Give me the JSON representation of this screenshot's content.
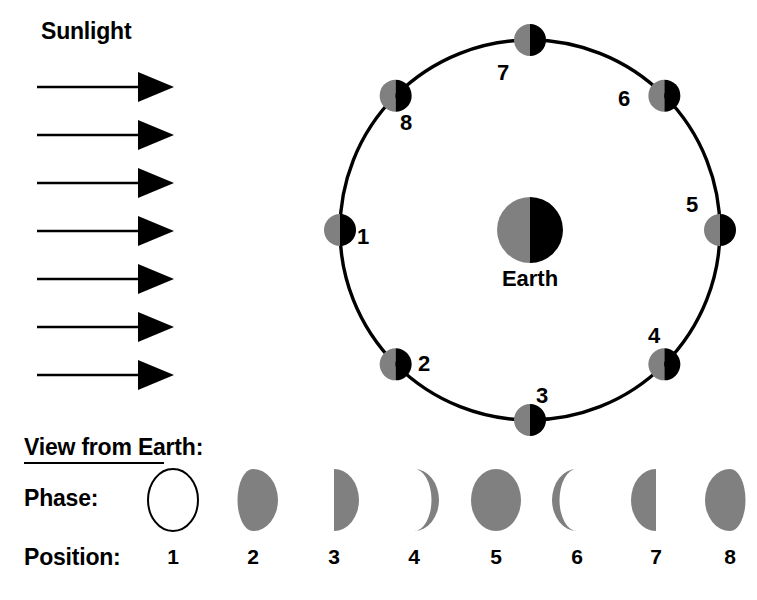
{
  "figure": {
    "title_sunlight": "Sunlight",
    "earth_label": "Earth",
    "view_label": "View from Earth:",
    "phase_label": "Phase:",
    "position_label": "Position:"
  },
  "colors": {
    "lit": "#808080",
    "dark": "#000000",
    "outline": "#000000",
    "background": "#ffffff"
  },
  "chart_data": {
    "type": "diagram",
    "sunlight": {
      "label": "Sunlight",
      "direction": "left-to-right",
      "arrow_count": 7
    },
    "earth": {
      "label": "Earth",
      "lit_side": "left",
      "dark_side": "right"
    },
    "orbit": {
      "center_x": 530,
      "center_y": 230,
      "radius": 190,
      "moon_lit_side": "left",
      "moon_dark_side": "right",
      "order": "counterclockwise from left"
    },
    "positions": [
      {
        "number": "1",
        "angle_deg": 180,
        "label_side": "right",
        "phase_name": "New Moon",
        "illumination": 0.0,
        "lit_limb": "none"
      },
      {
        "number": "2",
        "angle_deg": 225,
        "label_side": "upper-right",
        "phase_name": "Waxing Crescent",
        "illumination": 0.15,
        "lit_limb": "right"
      },
      {
        "number": "3",
        "angle_deg": 270,
        "label_side": "above",
        "phase_name": "First Quarter",
        "illumination": 0.5,
        "lit_limb": "right"
      },
      {
        "number": "4",
        "angle_deg": 315,
        "label_side": "upper-left",
        "phase_name": "Waxing Gibbous",
        "illumination": 0.8,
        "lit_limb": "right"
      },
      {
        "number": "5",
        "angle_deg": 0,
        "label_side": "upper-left",
        "phase_name": "Full Moon",
        "illumination": 1.0,
        "lit_limb": "full"
      },
      {
        "number": "6",
        "angle_deg": 45,
        "label_side": "left",
        "phase_name": "Waning Gibbous",
        "illumination": 0.8,
        "lit_limb": "left"
      },
      {
        "number": "7",
        "angle_deg": 90,
        "label_side": "below-left",
        "phase_name": "Last Quarter",
        "illumination": 0.5,
        "lit_limb": "left"
      },
      {
        "number": "8",
        "angle_deg": 135,
        "label_side": "below-right",
        "phase_name": "Waning Crescent",
        "illumination": 0.15,
        "lit_limb": "left"
      }
    ],
    "phase_row": {
      "row_label": "Phase:",
      "position_row_label": "Position:",
      "positions": [
        "1",
        "2",
        "3",
        "4",
        "5",
        "6",
        "7",
        "8"
      ],
      "shapes": [
        "new",
        "waxing-crescent",
        "first-quarter",
        "waxing-gibbous",
        "full",
        "waning-gibbous",
        "last-quarter",
        "waning-crescent"
      ]
    }
  },
  "orbit_labels": [
    {
      "number": "1",
      "x": 357,
      "y": 226
    },
    {
      "number": "2",
      "x": 418,
      "y": 353
    },
    {
      "number": "3",
      "x": 536,
      "y": 385
    },
    {
      "number": "4",
      "x": 648,
      "y": 325
    },
    {
      "number": "5",
      "x": 686,
      "y": 194
    },
    {
      "number": "6",
      "x": 618,
      "y": 88
    },
    {
      "number": "7",
      "x": 497,
      "y": 62
    },
    {
      "number": "8",
      "x": 400,
      "y": 112
    }
  ],
  "phase_positions": [
    {
      "number": "1",
      "cx": 173,
      "cy": 500
    },
    {
      "number": "2",
      "cx": 253,
      "cy": 500
    },
    {
      "number": "3",
      "cx": 334,
      "cy": 500
    },
    {
      "number": "4",
      "cx": 414,
      "cy": 500
    },
    {
      "number": "5",
      "cx": 496,
      "cy": 500
    },
    {
      "number": "6",
      "cx": 577,
      "cy": 500
    },
    {
      "number": "7",
      "cx": 656,
      "cy": 500
    },
    {
      "number": "8",
      "cx": 730,
      "cy": 500
    }
  ]
}
